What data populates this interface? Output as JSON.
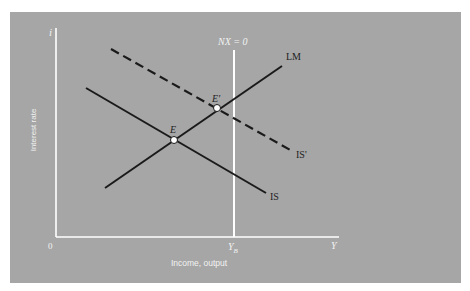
{
  "diagram": {
    "type": "IS-LM with balance-of-payments (NX = 0)",
    "colors": {
      "background": "#a6a6a6",
      "axes": "#ffffff",
      "curves": "#1a1a1a",
      "nx_line": "#ffffff",
      "text_dark": "#1e1e1e",
      "text_light": "#f2f2f2"
    },
    "axes": {
      "y_symbol": "i",
      "y_label": "Interest rate",
      "x_symbol": "Y",
      "x_label": "Income, output",
      "origin_label": "0",
      "x_tick_label": "Y",
      "x_tick_subscript": "B"
    },
    "curves": {
      "lm_label": "LM",
      "is_label": "IS",
      "is_shifted_label": "IS'",
      "nx_label": "NX = 0"
    },
    "points": {
      "e_label": "E",
      "e_prime_label": "E'"
    }
  }
}
